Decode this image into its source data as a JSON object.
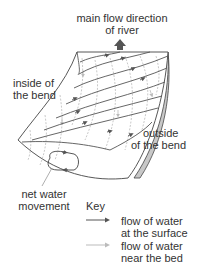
{
  "diagram": {
    "title_label": {
      "line1": "main flow direction",
      "line2": "of river"
    },
    "inside_label": {
      "line1": "inside of",
      "line2": "the bend"
    },
    "outside_label": {
      "line1": "outside",
      "line2": "of the bend"
    },
    "net_label": {
      "line1": "net water",
      "line2": "movement"
    },
    "colors": {
      "surface_flow": "#555555",
      "bed_flow": "#bbbbbb",
      "outline": "#444444",
      "bank_shade": "#c8c8c8",
      "main_arrow": "#555555"
    }
  },
  "key": {
    "title": "Key",
    "items": [
      {
        "line1": "flow of water",
        "line2": "at the surface",
        "style": "surface"
      },
      {
        "line1": "flow of water",
        "line2": "near the bed",
        "style": "bed"
      }
    ]
  }
}
